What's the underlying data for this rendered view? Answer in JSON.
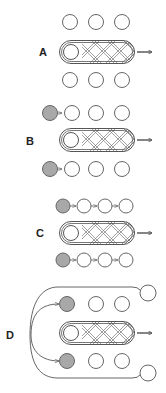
{
  "panels": [
    {
      "label": "A",
      "description": "Capsule with two neutral rows"
    },
    {
      "label": "B",
      "description": "Grey circle added to each row"
    },
    {
      "label": "C",
      "description": "Chained rows with grey lead circle"
    },
    {
      "label": "D",
      "description": "Loop feeding grey circles from outer circles"
    }
  ],
  "colors": {
    "stroke": "#555555",
    "fill_grey": "#a8a8a8",
    "fill_white": "#ffffff",
    "hatch": "#777777"
  }
}
